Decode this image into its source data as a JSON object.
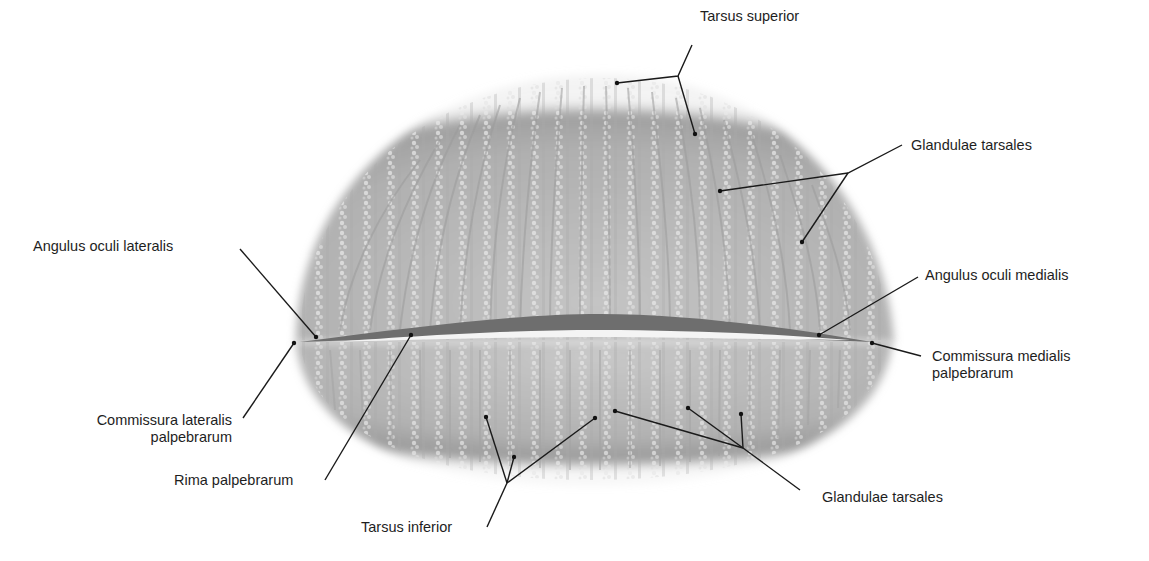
{
  "figure": {
    "colors": {
      "background": "#ffffff",
      "tissue_base": "#b9b9b9",
      "tissue_edge": "#8d8d8d",
      "gland_highlight": "#e6e6e6",
      "fissure_dark": "#6e6e6e",
      "fissure_light": "#f4f4f4",
      "leader_line": "#1a1a1a",
      "text": "#1e1e1e"
    }
  },
  "labels": {
    "tarsus_superior": "Tarsus superior",
    "glandulae_tarsales_upper": "Glandulae tarsales",
    "angulus_oculi_lateralis": "Angulus oculi lateralis",
    "angulus_oculi_medialis": "Angulus oculi medialis",
    "commissura_medialis_line1": "Commissura medialis",
    "commissura_medialis_line2": "palpebrarum",
    "commissura_lateralis_line1": "Commissura lateralis",
    "commissura_lateralis_line2": "palpebrarum",
    "rima_palpebrarum": "Rima palpebrarum",
    "tarsus_inferior": "Tarsus inferior",
    "glandulae_tarsales_lower": "Glandulae tarsales"
  }
}
